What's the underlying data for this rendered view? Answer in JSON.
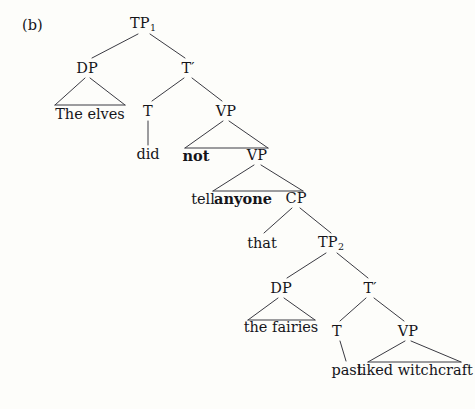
{
  "figure": {
    "panel_label": "(b)",
    "type": "syntax-tree-diagram",
    "background_color": "#fdfdfa",
    "line_color": "#3a3a42",
    "text_color": "#15151a"
  },
  "nodes": {
    "tp1": {
      "label": "TP",
      "subscript": "1",
      "x": 143,
      "y": 24
    },
    "dp1": {
      "label": "DP",
      "x": 87,
      "y": 68
    },
    "tbar1": {
      "label": "T′",
      "x": 188,
      "y": 68
    },
    "t1": {
      "label": "T",
      "x": 148,
      "y": 111
    },
    "vp1": {
      "label": "VP",
      "x": 226,
      "y": 111
    },
    "vp2": {
      "label": "VP",
      "x": 257,
      "y": 155
    },
    "cp": {
      "label": "CP",
      "x": 296,
      "y": 198
    },
    "tp2": {
      "label": "TP",
      "subscript": "2",
      "x": 331,
      "y": 243
    },
    "dp2": {
      "label": "DP",
      "x": 281,
      "y": 288
    },
    "tbar2": {
      "label": "T′",
      "x": 370,
      "y": 288
    },
    "t2": {
      "label": "T",
      "x": 337,
      "y": 331
    },
    "vp3": {
      "label": "VP",
      "x": 408,
      "y": 331
    }
  },
  "leaves": {
    "the_elves": {
      "text": "The elves",
      "x": 90,
      "y": 114
    },
    "did": {
      "text": "did",
      "x": 148,
      "y": 154
    },
    "not": {
      "text": "not",
      "bold": true,
      "x": 196,
      "y": 156
    },
    "tell": {
      "text": "tell",
      "bold": false,
      "x": 203,
      "y": 199
    },
    "anyone": {
      "text": "anyone",
      "bold": true,
      "x": 243,
      "y": 199
    },
    "that": {
      "text": "that",
      "x": 262,
      "y": 243
    },
    "the_fairies": {
      "text": "the fairies",
      "x": 281,
      "y": 327
    },
    "past": {
      "text": "past",
      "x": 347,
      "y": 370
    },
    "liked_witchcraft": {
      "text": "liked witchcraft",
      "x": 415,
      "y": 370
    }
  },
  "sentence": "The elves did not tell anyone that the fairies past liked witchcraft",
  "bold_words": [
    "not",
    "anyone"
  ]
}
